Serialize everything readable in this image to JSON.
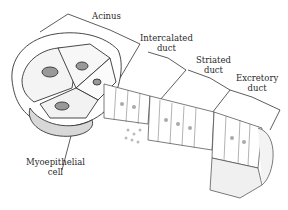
{
  "diagram": {
    "labels": {
      "acinus": "Acinus",
      "intercalated_duct": [
        "Intercalated",
        "duct"
      ],
      "striated_duct": [
        "Striated",
        "duct"
      ],
      "excretory_duct": [
        "Excretory",
        "duct"
      ],
      "myoepithelial_cell": [
        "Myoepithelial",
        "cell"
      ]
    },
    "colors": {
      "ink": "#2a2a2a",
      "background": "#ffffff",
      "stipple": "#bbbbbb"
    }
  }
}
